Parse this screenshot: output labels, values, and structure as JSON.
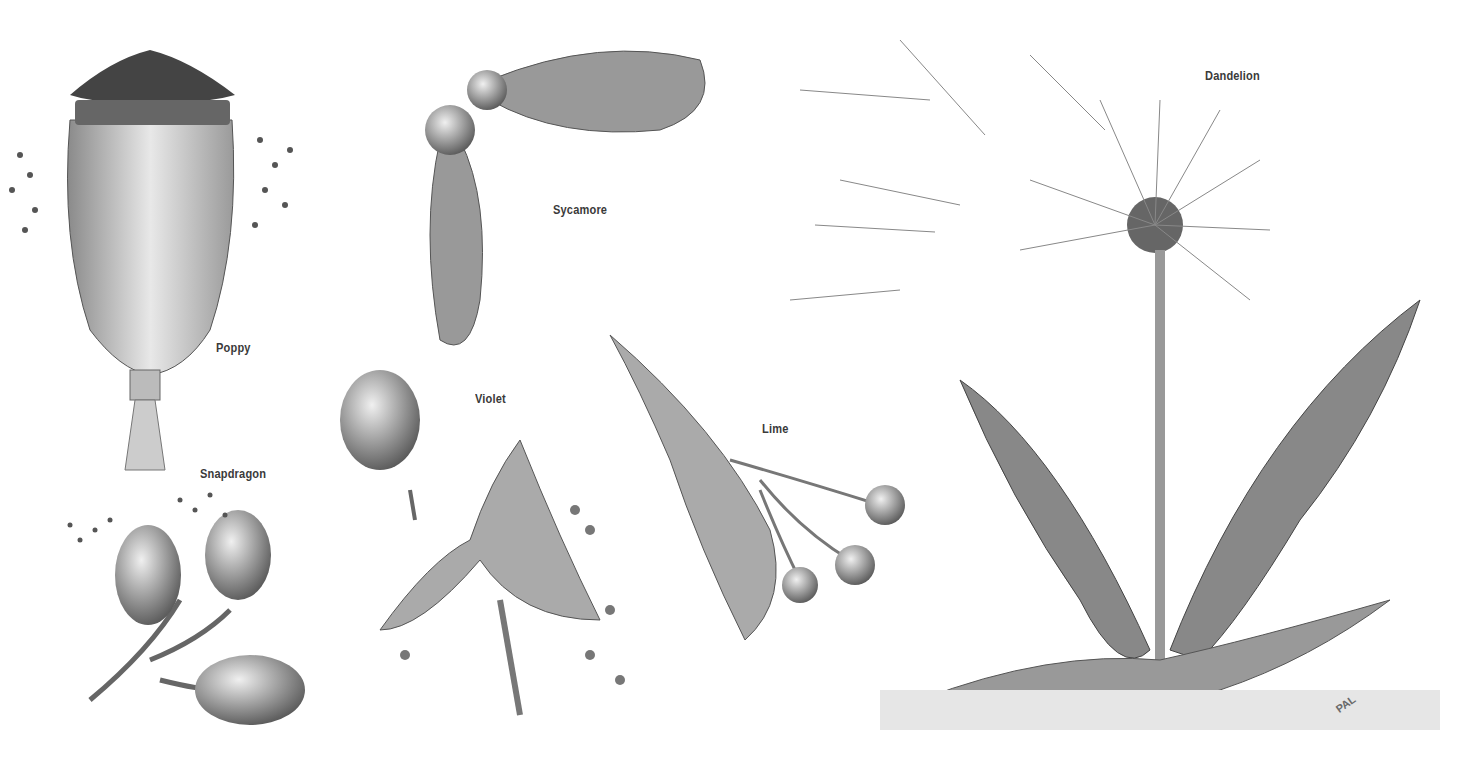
{
  "illustration": {
    "subject": "Seed dispersal of plants",
    "labels": [
      {
        "id": "poppy",
        "text": "Poppy",
        "x": 216,
        "y": 340
      },
      {
        "id": "snapdragon",
        "text": "Snapdragon",
        "x": 200,
        "y": 466
      },
      {
        "id": "sycamore",
        "text": "Sycamore",
        "x": 553,
        "y": 202
      },
      {
        "id": "violet",
        "text": "Violet",
        "x": 475,
        "y": 391
      },
      {
        "id": "lime",
        "text": "Lime",
        "x": 762,
        "y": 421
      },
      {
        "id": "dandelion",
        "text": "Dandelion",
        "x": 1205,
        "y": 68
      }
    ],
    "signature": "PAL",
    "colors": {
      "background": "#ffffff",
      "ink": "#3a3a3a",
      "shade": "#9a9a9a",
      "light": "#d6d6d6"
    }
  }
}
